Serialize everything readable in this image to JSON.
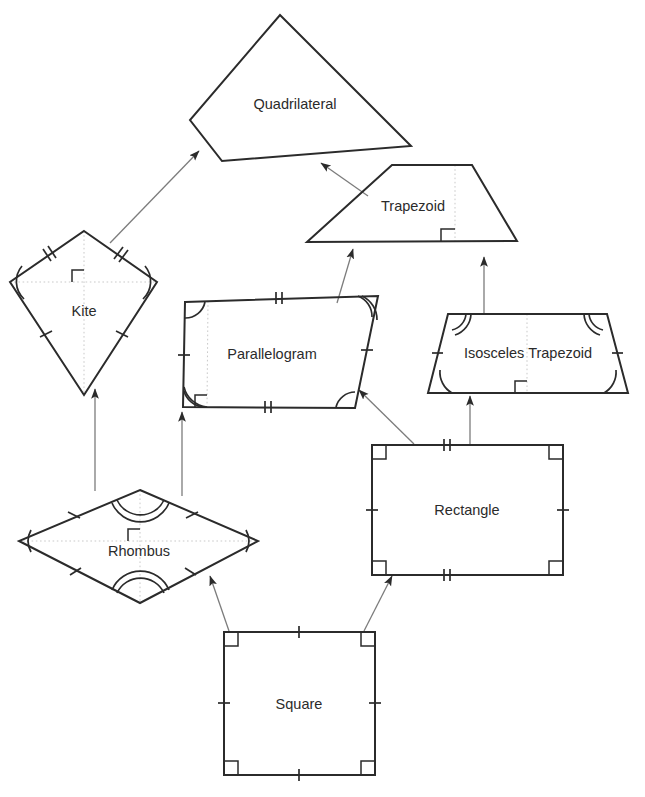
{
  "diagram": {
    "type": "hierarchy-diagram",
    "canvas": {
      "width": 645,
      "height": 797,
      "background": "#ffffff"
    },
    "colors": {
      "shape_stroke": "#2b2b2b",
      "arrow_stroke": "#7c7c7c",
      "diagonal_guide": "#c9c9c9",
      "label_text": "#2b2b2b",
      "background": "#ffffff"
    },
    "nodes": [
      {
        "id": "quadrilateral",
        "label": "Quadrilateral",
        "shape": "irregular-quadrilateral",
        "label_x": 295,
        "label_y": 105,
        "points": "280,15 411,146 222,161 190,120",
        "marks": []
      },
      {
        "id": "trapezoid",
        "label": "Trapezoid",
        "shape": "trapezoid",
        "label_x": 413,
        "label_y": 207,
        "points": "392,165 472,165 517,241 307,242",
        "marks": [
          "height-segment",
          "right-angle"
        ]
      },
      {
        "id": "kite",
        "label": "Kite",
        "shape": "kite",
        "label_x": 84,
        "label_y": 312,
        "points": "84,231 157,282 84,395 10,282",
        "marks": [
          "double-tick-upper-sides",
          "single-tick-lower-sides",
          "arc-left",
          "arc-right",
          "diagonals",
          "right-angle"
        ]
      },
      {
        "id": "parallelogram",
        "label": "Parallelogram",
        "shape": "parallelogram",
        "label_x": 272,
        "label_y": 355,
        "points": "185,302 378,296 355,408 183,407",
        "marks": [
          "double-tick-top",
          "double-tick-bottom",
          "single-tick-sides",
          "arc-corners",
          "height-segment",
          "right-angle"
        ]
      },
      {
        "id": "isosceles-trapezoid",
        "label": "Isosceles Trapezoid",
        "shape": "isosceles-trapezoid",
        "label_x": 528,
        "label_y": 354,
        "points": "448,314 607,314 628,393 428,393",
        "marks": [
          "double-arc-top-corners",
          "single-arc-bottom-corners",
          "single-tick-legs",
          "height-segment",
          "right-angle"
        ]
      },
      {
        "id": "rhombus",
        "label": "Rhombus",
        "shape": "rhombus",
        "label_x": 139,
        "label_y": 552,
        "points": "140,490 258,541 140,603 19,541",
        "marks": [
          "single-tick-all-sides",
          "double-arc-top",
          "double-arc-bottom",
          "arc-left",
          "arc-right",
          "diagonals",
          "right-angle"
        ]
      },
      {
        "id": "rectangle",
        "label": "Rectangle",
        "shape": "rectangle",
        "label_x": 467,
        "label_y": 511,
        "points": "372,445 563,445 563,575 372,575",
        "marks": [
          "right-angle-4-corners",
          "double-tick-top",
          "double-tick-bottom",
          "single-tick-sides"
        ]
      },
      {
        "id": "square",
        "label": "Square",
        "shape": "square",
        "label_x": 299,
        "label_y": 705,
        "points": "224,632 375,632 375,775 224,775",
        "marks": [
          "right-angle-4-corners",
          "single-tick-all-sides"
        ]
      }
    ],
    "edges": [
      {
        "from": "kite",
        "to": "quadrilateral",
        "x1": 110,
        "y1": 243,
        "x2": 199,
        "y2": 151
      },
      {
        "from": "trapezoid",
        "to": "quadrilateral",
        "x1": 368,
        "y1": 196,
        "x2": 321,
        "y2": 163
      },
      {
        "from": "parallelogram",
        "to": "trapezoid",
        "x1": 337,
        "y1": 303,
        "x2": 353,
        "y2": 249
      },
      {
        "from": "isosceles-trapezoid",
        "to": "trapezoid",
        "x1": 484,
        "y1": 313,
        "x2": 484,
        "y2": 257
      },
      {
        "from": "rectangle",
        "to": "parallelogram",
        "x1": 414,
        "y1": 444,
        "x2": 359,
        "y2": 390
      },
      {
        "from": "rectangle",
        "to": "isosceles-trapezoid",
        "x1": 470,
        "y1": 444,
        "x2": 470,
        "y2": 396
      },
      {
        "from": "rhombus",
        "to": "kite",
        "x1": 95,
        "y1": 491,
        "x2": 95,
        "y2": 389
      },
      {
        "from": "rhombus",
        "to": "parallelogram",
        "x1": 182,
        "y1": 496,
        "x2": 182,
        "y2": 412
      },
      {
        "from": "square",
        "to": "rhombus",
        "x1": 229,
        "y1": 631,
        "x2": 210,
        "y2": 576
      },
      {
        "from": "square",
        "to": "rectangle",
        "x1": 364,
        "y1": 631,
        "x2": 392,
        "y2": 576
      }
    ]
  }
}
